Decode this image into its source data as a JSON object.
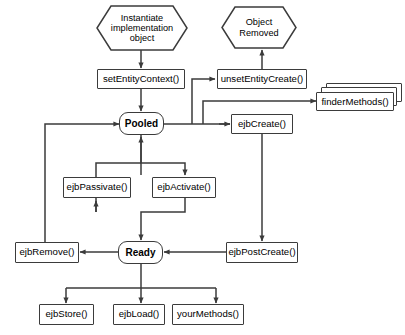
{
  "diagram": {
    "type": "state-diagram",
    "colors": {
      "stroke": "#3b3b3b",
      "fill": "#ffffff",
      "text": "#000000"
    },
    "nodes": {
      "instantiate": {
        "label": "Instantiate implementation object",
        "shape": "hexagon"
      },
      "object_removed": {
        "label": "Object Removed",
        "shape": "hexagon"
      },
      "set_entity_context": {
        "label": "setEntityContext()",
        "shape": "rect"
      },
      "unset_entity_create": {
        "label": "unsetEntityCreate()",
        "shape": "rect"
      },
      "finder_methods": {
        "label": "finderMethods()",
        "shape": "stacked-rect"
      },
      "pooled": {
        "label": "Pooled",
        "shape": "rounded-state"
      },
      "ejb_create": {
        "label": "ejbCreate()",
        "shape": "rect"
      },
      "ejb_passivate": {
        "label": "ejbPassivate()",
        "shape": "rect"
      },
      "ejb_activate": {
        "label": "ejbActivate()",
        "shape": "rect"
      },
      "ejb_remove": {
        "label": "ejbRemove()",
        "shape": "rect"
      },
      "ready": {
        "label": "Ready",
        "shape": "rounded-state"
      },
      "ejb_post_create": {
        "label": "ejbPostCreate()",
        "shape": "rect"
      },
      "ejb_store": {
        "label": "ejbStore()",
        "shape": "rect"
      },
      "ejb_load": {
        "label": "ejbLoad()",
        "shape": "rect"
      },
      "your_methods": {
        "label": "yourMethods()",
        "shape": "rect"
      }
    },
    "edges": [
      {
        "from": "instantiate",
        "to": "set_entity_context"
      },
      {
        "from": "set_entity_context",
        "to": "pooled"
      },
      {
        "from": "pooled",
        "to": "unset_entity_create"
      },
      {
        "from": "unset_entity_create",
        "to": "object_removed"
      },
      {
        "from": "pooled",
        "to": "finder_methods"
      },
      {
        "from": "pooled",
        "to": "ejb_create"
      },
      {
        "from": "ejb_create",
        "to": "ejb_post_create"
      },
      {
        "from": "ejb_post_create",
        "to": "ready"
      },
      {
        "from": "pooled",
        "to": "ejb_activate"
      },
      {
        "from": "ejb_activate",
        "to": "ready"
      },
      {
        "from": "ready",
        "to": "ejb_passivate"
      },
      {
        "from": "ejb_passivate",
        "to": "pooled"
      },
      {
        "from": "ready",
        "to": "ejb_remove"
      },
      {
        "from": "ejb_remove",
        "to": "pooled"
      },
      {
        "from": "ready",
        "to": "ejb_store"
      },
      {
        "from": "ready",
        "to": "ejb_load"
      },
      {
        "from": "ready",
        "to": "your_methods"
      }
    ]
  }
}
